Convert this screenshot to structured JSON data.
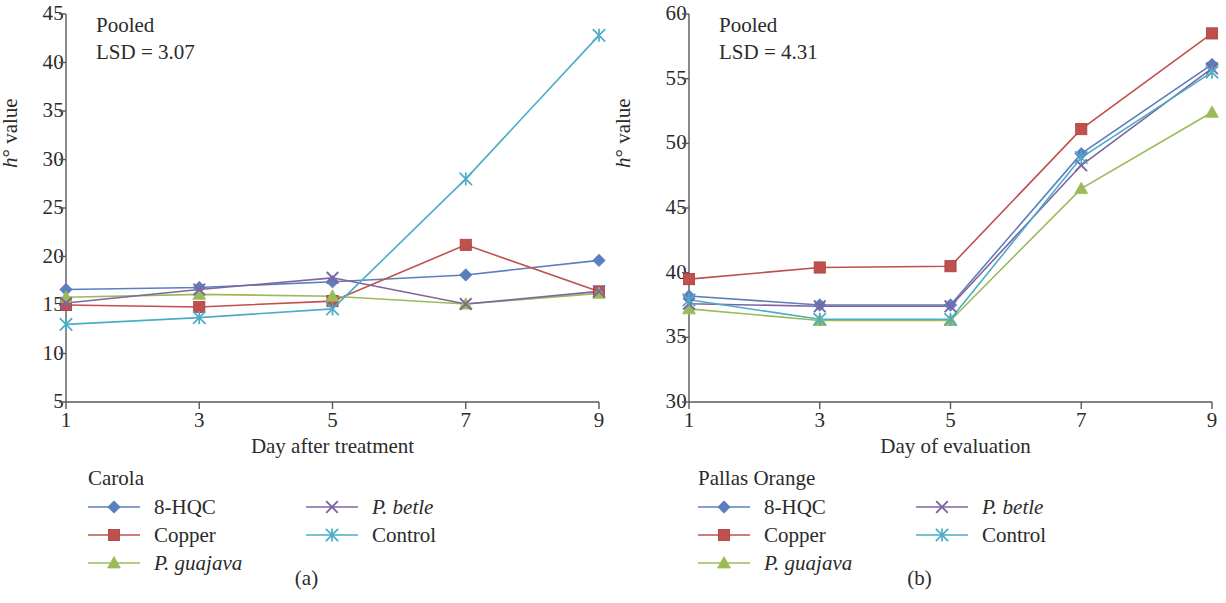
{
  "figure": {
    "panels": [
      {
        "caption": "(a)",
        "annotation_line1": "Pooled",
        "annotation_line2": "LSD = 3.07",
        "legend_title": "Carola",
        "chart_data": {
          "type": "line",
          "title": "",
          "subtitle": "Pooled LSD = 3.07",
          "xlabel": "Day after treatment",
          "ylabel": "h° value",
          "x": [
            1,
            3,
            5,
            7,
            9
          ],
          "xtick_labels": [
            "1",
            "3",
            "5",
            "7",
            "9"
          ],
          "ytick_labels": [
            "5",
            "10",
            "15",
            "20",
            "25",
            "30",
            "35",
            "40",
            "45"
          ],
          "ylim": [
            5,
            45
          ],
          "xlim": [
            1,
            9
          ],
          "grid": false,
          "legend_position": "below",
          "series": [
            {
              "name": "8-HQC",
              "marker": "diamond",
              "color": "#5b7fbd",
              "values": [
                16.6,
                16.8,
                17.4,
                18.1,
                19.6
              ]
            },
            {
              "name": "Copper",
              "marker": "square",
              "color": "#c0504d",
              "values": [
                15.0,
                14.8,
                15.4,
                21.2,
                16.4
              ]
            },
            {
              "name": "P. guajava",
              "marker": "triangle",
              "color": "#9bbb59",
              "values": [
                15.8,
                16.1,
                15.9,
                15.1,
                16.2
              ]
            },
            {
              "name": "P. betle",
              "marker": "cross",
              "color": "#8064a2",
              "values": [
                15.2,
                16.6,
                17.8,
                15.1,
                16.4
              ]
            },
            {
              "name": "Control",
              "marker": "asterisk",
              "color": "#4bacc6",
              "values": [
                13.0,
                13.7,
                14.6,
                28.0,
                42.8
              ]
            }
          ]
        }
      },
      {
        "caption": "(b)",
        "annotation_line1": "Pooled",
        "annotation_line2": "LSD = 4.31",
        "legend_title": "Pallas Orange",
        "chart_data": {
          "type": "line",
          "title": "",
          "subtitle": "Pooled LSD = 4.31",
          "xlabel": "Day of evaluation",
          "ylabel": "h° value",
          "x": [
            1,
            3,
            5,
            7,
            9
          ],
          "xtick_labels": [
            "1",
            "3",
            "5",
            "7",
            "9"
          ],
          "ytick_labels": [
            "30",
            "35",
            "40",
            "45",
            "50",
            "55",
            "60"
          ],
          "ylim": [
            30,
            60
          ],
          "xlim": [
            1,
            9
          ],
          "grid": false,
          "legend_position": "below",
          "series": [
            {
              "name": "8-HQC",
              "marker": "diamond",
              "color": "#5b7fbd",
              "values": [
                38.2,
                37.5,
                37.5,
                49.2,
                56.1
              ]
            },
            {
              "name": "Copper",
              "marker": "square",
              "color": "#c0504d",
              "values": [
                39.5,
                40.4,
                40.5,
                51.1,
                58.5
              ]
            },
            {
              "name": "P. guajava",
              "marker": "triangle",
              "color": "#9bbb59",
              "values": [
                37.2,
                36.3,
                36.3,
                46.5,
                52.4
              ]
            },
            {
              "name": "P. betle",
              "marker": "cross",
              "color": "#8064a2",
              "values": [
                37.6,
                37.4,
                37.4,
                48.3,
                55.8
              ]
            },
            {
              "name": "Control",
              "marker": "asterisk",
              "color": "#4bacc6",
              "values": [
                37.9,
                36.4,
                36.4,
                48.9,
                55.5
              ]
            }
          ]
        }
      }
    ]
  },
  "axis_label_y_prefix": "h",
  "axis_label_y_suffix": " value"
}
